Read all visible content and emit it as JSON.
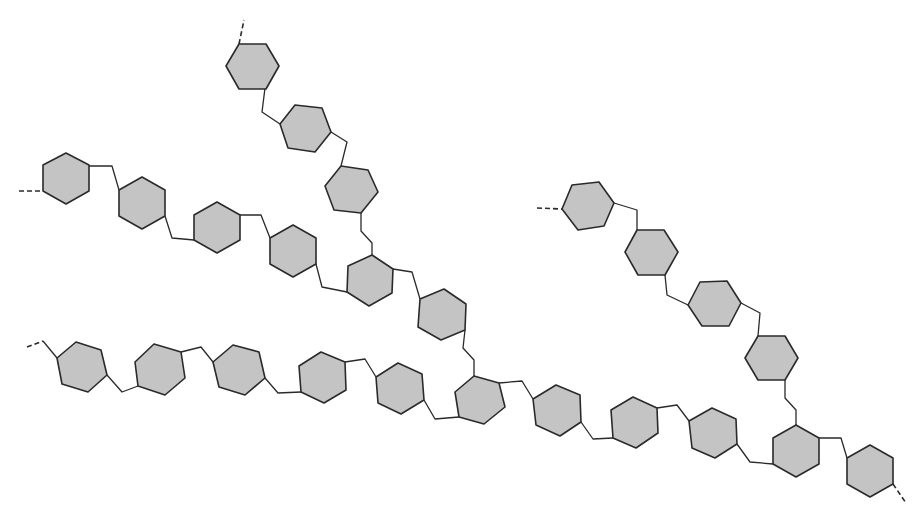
{
  "diagram": {
    "title": "Branched chain of hexagonal sugar units",
    "colors": {
      "background": "#ffffff",
      "unit_fill": "#c4c4c4",
      "stroke": "#2a2a2a"
    },
    "units": [
      {
        "id": "upper-1",
        "branch": "upper",
        "points": "226,66 239,44 266,44 279,66 266,89 239,89"
      },
      {
        "id": "upper-2",
        "branch": "upper",
        "points": "280,124 295,105 322,108 331,132 315,152 288,148"
      },
      {
        "id": "upper-3",
        "branch": "upper",
        "points": "325,186 341,166 368,170 378,192 361,213 334,210"
      },
      {
        "id": "left-1",
        "branch": "left",
        "points": "66,153 89,165 89,191 66,204 43,191 43,165"
      },
      {
        "id": "left-2",
        "branch": "left",
        "points": "142,177 165,190 165,216 142,229 119,216 119,190"
      },
      {
        "id": "left-3",
        "branch": "left",
        "points": "217,202 240,215 240,240 217,253 194,240 194,215"
      },
      {
        "id": "left-4",
        "branch": "left",
        "points": "293,225 316,238 316,264 293,277 270,264 270,238"
      },
      {
        "id": "junction-upper",
        "branch": "junction",
        "points": "372,255 393,269 392,293 369,306 347,292 348,266"
      },
      {
        "id": "mid-1",
        "branch": "mid",
        "points": "420,299 444,289 466,304 465,330 441,340 418,327"
      },
      {
        "id": "main-1",
        "branch": "main",
        "points": "57,358 76,342 101,350 107,375 88,392 62,384"
      },
      {
        "id": "main-2",
        "branch": "main",
        "points": "135,362 154,344 181,352 185,378 165,395 138,386"
      },
      {
        "id": "main-3",
        "branch": "main",
        "points": "213,362 233,345 259,352 265,378 245,395 219,387"
      },
      {
        "id": "main-4",
        "branch": "main",
        "points": "321,352 345,362 346,390 324,403 301,392 299,366"
      },
      {
        "id": "main-5",
        "branch": "main",
        "points": "376,377 398,363 422,374 424,400 401,414 378,403"
      },
      {
        "id": "junction-main",
        "branch": "junction",
        "points": "474,376 499,383 505,407 484,424 459,417 455,392"
      },
      {
        "id": "main-6",
        "branch": "main",
        "points": "533,399 556,385 580,395 581,422 560,436 536,425"
      },
      {
        "id": "main-7",
        "branch": "main",
        "points": "611,410 633,397 657,408 658,433 636,448 613,438"
      },
      {
        "id": "main-8",
        "branch": "main",
        "points": "689,421 712,408 736,419 737,444 715,458 692,448"
      },
      {
        "id": "junction-right",
        "branch": "junction",
        "points": "796,425 819,438 819,464 796,477 773,464 773,438"
      },
      {
        "id": "main-9",
        "branch": "main",
        "points": "870,445 893,458 893,484 870,497 847,484 847,458"
      },
      {
        "id": "right-1",
        "branch": "right",
        "points": "562,209 572,185 599,182 614,203 604,226 578,230"
      },
      {
        "id": "right-2",
        "branch": "right",
        "points": "625,252 637,230 664,230 678,252 665,275 638,275"
      },
      {
        "id": "right-3",
        "branch": "right",
        "points": "688,305 700,282 727,281 741,303 729,326 702,326"
      },
      {
        "id": "right-4",
        "branch": "right",
        "points": "745,358 758,336 785,336 798,358 785,380 758,380"
      }
    ],
    "links": [
      {
        "id": "link-u1-u2",
        "points": "265,88 262,112 280,124"
      },
      {
        "id": "link-u2-u3",
        "points": "331,132 347,142 341,166"
      },
      {
        "id": "link-u3-j",
        "points": "361,213 361,231 372,243 372,255"
      },
      {
        "id": "link-l1-l2",
        "points": "89,166 112,166 119,190"
      },
      {
        "id": "link-l2-l3",
        "points": "165,216 172,238 194,240"
      },
      {
        "id": "link-l3-l4",
        "points": "240,215 261,215 270,238"
      },
      {
        "id": "link-l4-j",
        "points": "316,264 322,287 347,292"
      },
      {
        "id": "link-j-mid",
        "points": "393,269 412,272 420,299"
      },
      {
        "id": "link-mid-jm",
        "points": "465,330 463,348 474,360 474,376"
      },
      {
        "id": "link-m1-m2",
        "points": "107,375 122,392 138,386"
      },
      {
        "id": "link-m2-m3",
        "points": "181,352 201,347 213,362"
      },
      {
        "id": "link-m3-m4",
        "points": "265,378 278,393 301,392"
      },
      {
        "id": "link-m4-m5",
        "points": "345,362 365,359 376,377"
      },
      {
        "id": "link-m5-jm",
        "points": "424,400 435,419 459,417"
      },
      {
        "id": "link-jm-m6",
        "points": "499,383 522,381 533,399"
      },
      {
        "id": "link-m6-m7",
        "points": "581,422 593,439 613,438"
      },
      {
        "id": "link-m7-m8",
        "points": "657,408 677,405 689,421"
      },
      {
        "id": "link-m8-jr",
        "points": "737,444 750,462 773,464"
      },
      {
        "id": "link-jr-m9",
        "points": "819,438 841,438 847,458"
      },
      {
        "id": "link-r1-r2",
        "points": "614,203 637,210 637,230"
      },
      {
        "id": "link-r2-r3",
        "points": "665,275 667,295 688,305"
      },
      {
        "id": "link-r3-r4",
        "points": "741,303 760,313 758,336"
      },
      {
        "id": "link-r4-jr",
        "points": "785,380 785,398 796,410 796,425"
      },
      {
        "id": "link-m0-m1",
        "points": "43,341 57,358"
      }
    ],
    "continuations": [
      {
        "id": "cont-upper",
        "points": "239,44 244,20"
      },
      {
        "id": "cont-left",
        "points": "19,191 43,191"
      },
      {
        "id": "cont-main-start",
        "points": "27,347 43,341"
      },
      {
        "id": "cont-main-end",
        "points": "893,484 906,503"
      },
      {
        "id": "cont-right",
        "points": "537,208 562,209"
      }
    ]
  }
}
